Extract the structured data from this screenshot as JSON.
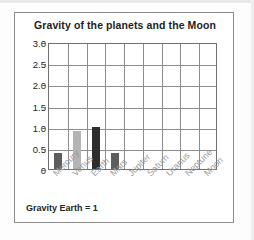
{
  "figure": {
    "title": "Gravity of the planets and the Moon",
    "footer_note": "Gravity Earth = 1"
  },
  "chart_data": {
    "type": "bar",
    "title": "Gravity of the planets and the Moon",
    "xlabel": "",
    "ylabel": "",
    "categories": [
      "Mercury",
      "Venus",
      "Earth",
      "Mars",
      "Jupiter",
      "Saturn",
      "Uranus",
      "Neptune",
      "Moon"
    ],
    "values": [
      0.38,
      0.9,
      1.0,
      0.38,
      null,
      null,
      null,
      null,
      null
    ],
    "bar_colors": [
      "#5d5d5d",
      "#b4b4b4",
      "#2d2d2d",
      "#5d5d5d",
      null,
      null,
      null,
      null,
      null
    ],
    "ylim": [
      0,
      3.0
    ],
    "ytick_labels": [
      "0",
      "0.5",
      "1.0",
      "1.5",
      "2.0",
      "2.5",
      "3.0"
    ],
    "ytick_values": [
      0,
      0.5,
      1.0,
      1.5,
      2.0,
      2.5,
      3.0
    ],
    "grid": true,
    "legend": "none",
    "annotation": "Gravity Earth = 1"
  },
  "style": {
    "grid_color": "#8d8d8d",
    "axis_color": "#6f6f6f",
    "frame_color": "#8b8b8b",
    "title_color": "#1e1e1e",
    "xlabel_color": "#9a9a9a"
  }
}
